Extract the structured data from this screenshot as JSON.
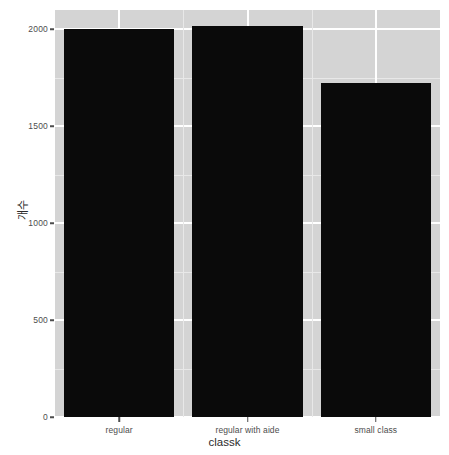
{
  "chart_data": {
    "type": "bar",
    "title": "",
    "subtitle": "",
    "xlabel": "classk",
    "ylabel": "개수",
    "categories": [
      "regular",
      "regular with aide",
      "small class"
    ],
    "values": [
      2000,
      2015,
      1725
    ],
    "series": [
      {
        "name": "count",
        "values": [
          2000,
          2015,
          1725
        ]
      }
    ],
    "ylim": [
      0,
      2100
    ],
    "y_ticks": [
      0,
      500,
      1000,
      1500,
      2000
    ],
    "y_tick_labels": [
      "0",
      "500",
      "1000",
      "1500",
      "2000"
    ],
    "y_minor_ticks": [
      250,
      750,
      1250,
      1750
    ],
    "grid": true,
    "legend": "none",
    "bar_color": "#0a0a0a",
    "panel_background": "#d4d4d4",
    "grid_color": "#ffffff",
    "minor_grid_color": "#e8e8e8",
    "axis_text_color": "#4d4d4d",
    "axis_title_color": "#2b2b2b"
  },
  "axes": {
    "y": {
      "title": "개수",
      "ticks": [
        {
          "value": 0,
          "label": "0"
        },
        {
          "value": 500,
          "label": "500"
        },
        {
          "value": 1000,
          "label": "1000"
        },
        {
          "value": 1500,
          "label": "1500"
        },
        {
          "value": 2000,
          "label": "2000"
        }
      ]
    },
    "x": {
      "title": "classk",
      "ticks": [
        {
          "label": "regular"
        },
        {
          "label": "regular with aide"
        },
        {
          "label": "small class"
        }
      ]
    }
  }
}
